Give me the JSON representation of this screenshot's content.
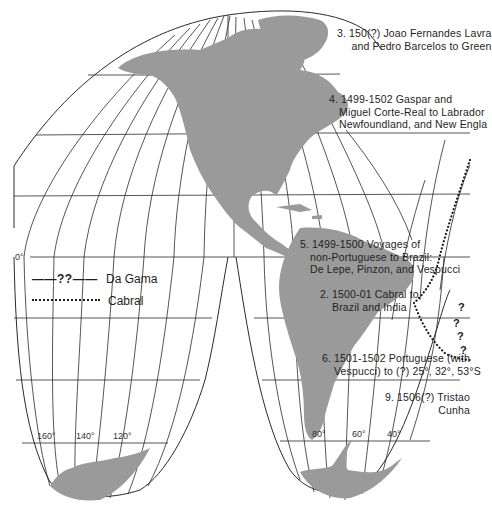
{
  "map": {
    "projection": "interrupted homolosine (North & South America lobes)",
    "land_color": "#9a9a9a",
    "line_color": "#2a2a2a",
    "equator_label": "0°",
    "longitude_labels_south_pacific": [
      "160°",
      "140°",
      "120°"
    ],
    "longitude_labels_south_america": [
      "80°",
      "60°",
      "40°"
    ]
  },
  "legend": {
    "da_gama": {
      "symbol": "——??——",
      "label": "Da Gama"
    },
    "cabral": {
      "symbol": "dotted",
      "label": "Cabral"
    }
  },
  "annotations": [
    {
      "id": "3",
      "lines": [
        "3. 150(?) Joao Fernandes Lavra",
        "and Pedro Barcelos to Green"
      ]
    },
    {
      "id": "4",
      "lines": [
        "4. 1499-1502 Gaspar and",
        "Miguel Corte-Real to Labrador",
        "Newfoundland, and New Engla"
      ]
    },
    {
      "id": "5",
      "lines": [
        "5. 1499-1500 Voyages of",
        "non-Portuguese to Brazil:",
        "De Lepe, Pinzon, and Vespucci"
      ]
    },
    {
      "id": "2",
      "lines": [
        "2. 1500-01 Cabral to",
        "Brazil and India"
      ]
    },
    {
      "id": "6",
      "lines": [
        "6. 1501-1502 Portuguese (with",
        "Vespucci) to (?) 25°, 32°, 53°S"
      ]
    },
    {
      "id": "9",
      "lines": [
        "9. 1506(?) Tristao",
        "Cunha"
      ]
    }
  ],
  "uncertain_marks": [
    "?",
    "?",
    "?",
    "?"
  ]
}
